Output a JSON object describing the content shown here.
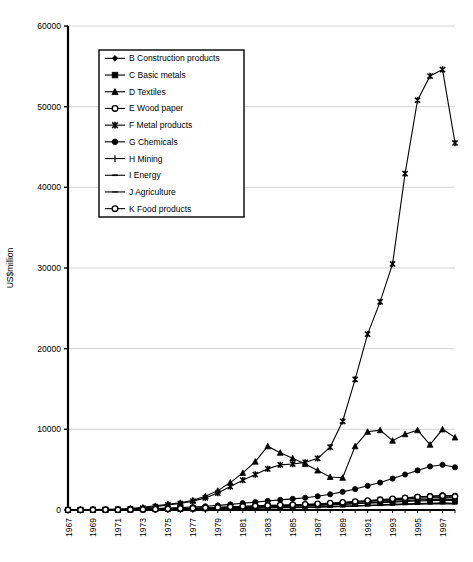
{
  "chart_data": {
    "type": "line",
    "title": "",
    "xlabel": "",
    "ylabel": "US$million",
    "ylim": [
      0,
      60000
    ],
    "ytick_values": [
      0,
      10000,
      20000,
      30000,
      40000,
      50000,
      60000
    ],
    "ytick_labels": [
      "0",
      "10000",
      "20000",
      "30000",
      "40000",
      "50000",
      "60000"
    ],
    "grid": true,
    "grid_axis": "y",
    "legend_position": "upper-left-inside",
    "x": [
      1967,
      1968,
      1969,
      1970,
      1971,
      1972,
      1973,
      1974,
      1975,
      1976,
      1977,
      1978,
      1979,
      1980,
      1981,
      1982,
      1983,
      1984,
      1985,
      1986,
      1987,
      1988,
      1989,
      1990,
      1991,
      1992,
      1993,
      1994,
      1995,
      1996,
      1997,
      1998
    ],
    "xtick_labels": [
      "1967",
      "1969",
      "1971",
      "1973",
      "1975",
      "1977",
      "1979",
      "1981",
      "1983",
      "1985",
      "1987",
      "1989",
      "1991",
      "1993",
      "1995",
      "1997"
    ],
    "xtick_values": [
      1967,
      1969,
      1971,
      1973,
      1975,
      1977,
      1979,
      1981,
      1983,
      1985,
      1987,
      1989,
      1991,
      1993,
      1995,
      1997
    ],
    "xlim": [
      1967,
      1998
    ],
    "series": [
      {
        "name": "B Construction products",
        "code": "B",
        "marker": "diamond",
        "color": "#000000",
        "values": [
          20,
          25,
          30,
          35,
          45,
          60,
          90,
          130,
          160,
          180,
          210,
          250,
          300,
          360,
          420,
          470,
          520,
          560,
          600,
          650,
          700,
          780,
          860,
          950,
          1050,
          1150,
          1250,
          1350,
          1450,
          1500,
          1550,
          1500
        ]
      },
      {
        "name": "C Basic metals",
        "code": "C",
        "marker": "square",
        "color": "#000000",
        "values": [
          15,
          18,
          22,
          28,
          35,
          50,
          80,
          110,
          140,
          160,
          190,
          220,
          260,
          310,
          360,
          400,
          440,
          470,
          500,
          540,
          580,
          640,
          700,
          770,
          840,
          910,
          980,
          1050,
          1120,
          1160,
          1200,
          1160
        ]
      },
      {
        "name": "D Textiles",
        "code": "D",
        "marker": "triangle",
        "color": "#000000",
        "values": [
          30,
          40,
          55,
          75,
          110,
          180,
          320,
          520,
          700,
          900,
          1200,
          1700,
          2400,
          3400,
          4600,
          6000,
          7900,
          7100,
          6400,
          5700,
          4900,
          4100,
          4000,
          7900,
          9700,
          9900,
          8600,
          9400,
          9900,
          8100,
          10000,
          9000
        ]
      },
      {
        "name": "E Wood paper",
        "code": "E",
        "marker": "circle-open",
        "color": "#000000",
        "values": [
          10,
          12,
          16,
          20,
          28,
          40,
          60,
          90,
          120,
          150,
          190,
          230,
          280,
          340,
          400,
          450,
          500,
          540,
          580,
          630,
          690,
          770,
          860,
          960,
          1080,
          1200,
          1320,
          1450,
          1600,
          1700,
          1800,
          1750
        ]
      },
      {
        "name": "F Metal products",
        "code": "F",
        "marker": "star",
        "color": "#000000",
        "values": [
          25,
          30,
          40,
          55,
          80,
          130,
          230,
          420,
          620,
          800,
          1100,
          1500,
          2100,
          2900,
          3700,
          4400,
          5100,
          5600,
          5700,
          5900,
          6400,
          7800,
          11000,
          16200,
          21800,
          25800,
          30500,
          41700,
          50800,
          53800,
          54600,
          45500
        ]
      },
      {
        "name": "G Chemicals",
        "code": "G",
        "marker": "circle-filled",
        "color": "#000000",
        "values": [
          20,
          24,
          30,
          38,
          50,
          70,
          110,
          170,
          230,
          290,
          370,
          460,
          570,
          700,
          840,
          980,
          1120,
          1250,
          1380,
          1520,
          1700,
          1950,
          2250,
          2600,
          3000,
          3400,
          3900,
          4400,
          4900,
          5400,
          5600,
          5300
        ]
      },
      {
        "name": "H Mining",
        "code": "H",
        "marker": "plus",
        "color": "#000000",
        "values": [
          8,
          10,
          13,
          17,
          23,
          33,
          50,
          75,
          100,
          125,
          155,
          190,
          230,
          280,
          330,
          375,
          420,
          455,
          490,
          530,
          580,
          650,
          720,
          800,
          890,
          980,
          1070,
          1160,
          1250,
          1300,
          1350,
          1300
        ]
      },
      {
        "name": "I Energy",
        "code": "I",
        "marker": "dash",
        "color": "#000000",
        "values": [
          5,
          6,
          8,
          10,
          14,
          20,
          32,
          48,
          64,
          80,
          100,
          120,
          145,
          175,
          205,
          230,
          255,
          275,
          295,
          320,
          350,
          390,
          430,
          480,
          530,
          580,
          630,
          680,
          730,
          760,
          790,
          760
        ]
      },
      {
        "name": "J Agriculture",
        "code": "J",
        "marker": "line",
        "color": "#000000",
        "values": [
          6,
          7,
          9,
          12,
          16,
          23,
          36,
          54,
          72,
          90,
          112,
          135,
          162,
          195,
          228,
          256,
          284,
          306,
          328,
          356,
          389,
          433,
          478,
          533,
          589,
          644,
          700,
          755,
          811,
          844,
          878,
          844
        ]
      },
      {
        "name": "K Food products",
        "code": "K",
        "marker": "circle-open-small",
        "color": "#000000",
        "values": [
          12,
          15,
          19,
          24,
          33,
          47,
          72,
          108,
          144,
          180,
          225,
          270,
          325,
          390,
          455,
          512,
          568,
          613,
          658,
          713,
          778,
          866,
          955,
          1066,
          1177,
          1288,
          1399,
          1510,
          1621,
          1688,
          1755,
          1688
        ]
      }
    ]
  },
  "axis": {
    "y_title": "US$million"
  }
}
